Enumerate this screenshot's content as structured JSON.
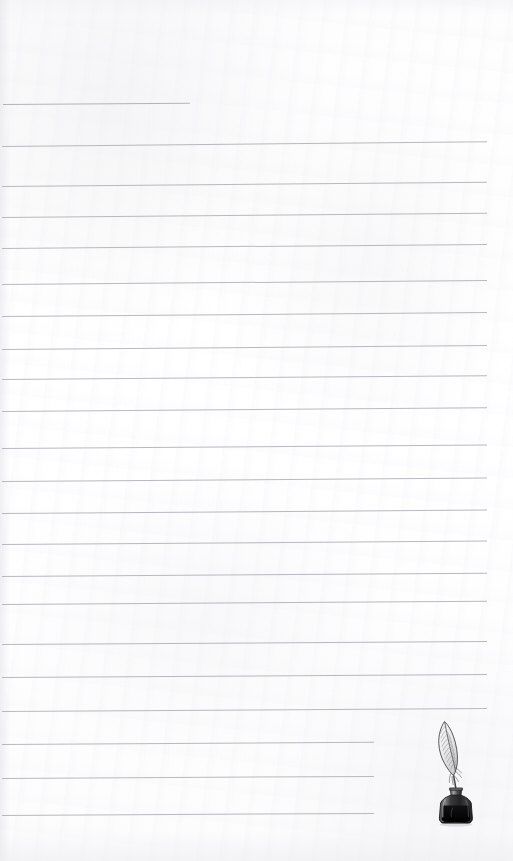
{
  "document": {
    "kind": "lined-notepaper-scan",
    "title": "Lined Notepaper with Quill and Inkwell",
    "page_width": 513,
    "page_height": 861,
    "paper_color": "#ffffff",
    "rule_color": "#a9aab0",
    "ink_color": "#1a1a1a"
  },
  "ruled_lines": {
    "count": 22,
    "left_margin": 3,
    "full_right_edge": 487,
    "note": "first line is a short header rule; final three lines are shortened to clear the illustration",
    "lines": [
      {
        "index": 1,
        "y": 104,
        "x1": 3,
        "x2": 190,
        "tilt": -0.35,
        "variant": "short-header"
      },
      {
        "index": 2,
        "y": 146,
        "x1": 2,
        "x2": 487,
        "tilt": -0.55,
        "variant": "full"
      },
      {
        "index": 3,
        "y": 186,
        "x1": 2,
        "x2": 487,
        "tilt": -0.5,
        "variant": "full"
      },
      {
        "index": 4,
        "y": 217,
        "x1": 2,
        "x2": 487,
        "tilt": -0.5,
        "variant": "full"
      },
      {
        "index": 5,
        "y": 248,
        "x1": 2,
        "x2": 487,
        "tilt": -0.48,
        "variant": "full"
      },
      {
        "index": 6,
        "y": 284,
        "x1": 2,
        "x2": 487,
        "tilt": -0.48,
        "variant": "full"
      },
      {
        "index": 7,
        "y": 316,
        "x1": 2,
        "x2": 487,
        "tilt": -0.46,
        "variant": "full"
      },
      {
        "index": 8,
        "y": 349,
        "x1": 2,
        "x2": 487,
        "tilt": -0.46,
        "variant": "full"
      },
      {
        "index": 9,
        "y": 379,
        "x1": 2,
        "x2": 487,
        "tilt": -0.44,
        "variant": "full"
      },
      {
        "index": 10,
        "y": 411,
        "x1": 2,
        "x2": 487,
        "tilt": -0.44,
        "variant": "full"
      },
      {
        "index": 11,
        "y": 448,
        "x1": 2,
        "x2": 487,
        "tilt": -0.42,
        "variant": "full"
      },
      {
        "index": 12,
        "y": 481,
        "x1": 2,
        "x2": 487,
        "tilt": -0.42,
        "variant": "full"
      },
      {
        "index": 13,
        "y": 513,
        "x1": 2,
        "x2": 487,
        "tilt": -0.4,
        "variant": "full"
      },
      {
        "index": 14,
        "y": 544,
        "x1": 2,
        "x2": 487,
        "tilt": -0.4,
        "variant": "full"
      },
      {
        "index": 15,
        "y": 576,
        "x1": 2,
        "x2": 487,
        "tilt": -0.38,
        "variant": "full"
      },
      {
        "index": 16,
        "y": 604,
        "x1": 2,
        "x2": 487,
        "tilt": -0.38,
        "variant": "full"
      },
      {
        "index": 17,
        "y": 644,
        "x1": 2,
        "x2": 487,
        "tilt": -0.36,
        "variant": "full"
      },
      {
        "index": 18,
        "y": 677,
        "x1": 2,
        "x2": 487,
        "tilt": -0.36,
        "variant": "full"
      },
      {
        "index": 19,
        "y": 711,
        "x1": 2,
        "x2": 487,
        "tilt": -0.34,
        "variant": "full"
      },
      {
        "index": 20,
        "y": 744,
        "x1": 2,
        "x2": 374,
        "tilt": -0.34,
        "variant": "short-illustration"
      },
      {
        "index": 21,
        "y": 778,
        "x1": 2,
        "x2": 374,
        "tilt": -0.32,
        "variant": "short-illustration"
      },
      {
        "index": 22,
        "y": 815,
        "x1": 2,
        "x2": 374,
        "tilt": -0.32,
        "variant": "short-illustration"
      }
    ]
  },
  "illustration": {
    "name": "quill-and-inkwell",
    "description": "Engraved quill feather pen standing in a dark glass ink bottle",
    "x": 428,
    "y": 716,
    "width": 56,
    "height": 112,
    "parts": [
      "feather-plume",
      "quill-shaft",
      "bottle-neck",
      "bottle-body",
      "ink"
    ]
  }
}
